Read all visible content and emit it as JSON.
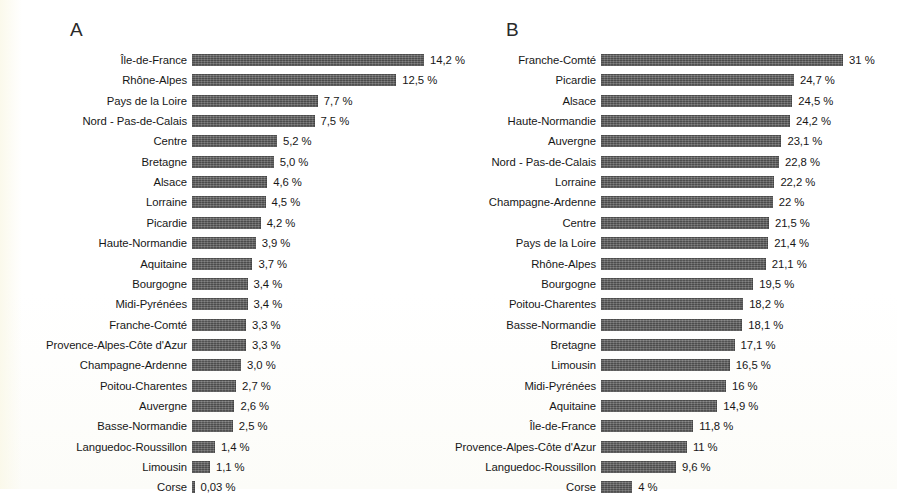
{
  "figure": {
    "background_color": "#fdfdfb",
    "bar_color": "#5f5f5f",
    "text_color": "#171717"
  },
  "panels": {
    "a": {
      "letter": "A",
      "bar_origin_x": 192,
      "px_per_unit": 16.34,
      "first_row_y": 50,
      "row_pitch": 20.35
    },
    "b": {
      "letter": "B",
      "bar_origin_x": 151,
      "px_per_unit": 7.81,
      "first_row_y": 50,
      "row_pitch": 20.35
    }
  },
  "chart_data": [
    {
      "type": "bar",
      "orientation": "horizontal",
      "panel": "A",
      "title": "A",
      "xlabel": "",
      "ylabel": "",
      "grid": false,
      "legend": false,
      "value_suffix": "%",
      "categories": [
        "Île-de-France",
        "Rhône-Alpes",
        "Pays de la Loire",
        "Nord - Pas-de-Calais",
        "Centre",
        "Bretagne",
        "Alsace",
        "Lorraine",
        "Picardie",
        "Haute-Normandie",
        "Aquitaine",
        "Bourgogne",
        "Midi-Pyrénées",
        "Franche-Comté",
        "Provence-Alpes-Côte d'Azur",
        "Champagne-Ardenne",
        "Poitou-Charentes",
        "Auvergne",
        "Basse-Normandie",
        "Languedoc-Roussillon",
        "Limousin",
        "Corse"
      ],
      "values": [
        14.2,
        12.5,
        7.7,
        7.5,
        5.2,
        5.0,
        4.6,
        4.5,
        4.2,
        3.9,
        3.7,
        3.4,
        3.4,
        3.3,
        3.3,
        3.0,
        2.7,
        2.6,
        2.5,
        1.4,
        1.1,
        0.03
      ],
      "value_labels": [
        "14,2 %",
        "12,5 %",
        "7,7 %",
        "7,5 %",
        "5,2 %",
        "5,0 %",
        "4,6 %",
        "4,5 %",
        "4,2 %",
        "3,9 %",
        "3,7 %",
        "3,4 %",
        "3,4 %",
        "3,3 %",
        "3,3 %",
        "3,0 %",
        "2,7 %",
        "2,6 %",
        "2,5 %",
        "1,4 %",
        "1,1 %",
        "0,03 %"
      ],
      "xlim": [
        0,
        15
      ]
    },
    {
      "type": "bar",
      "orientation": "horizontal",
      "panel": "B",
      "title": "B",
      "xlabel": "",
      "ylabel": "",
      "grid": false,
      "legend": false,
      "value_suffix": "%",
      "categories": [
        "Franche-Comté",
        "Picardie",
        "Alsace",
        "Haute-Normandie",
        "Auvergne",
        "Nord - Pas-de-Calais",
        "Lorraine",
        "Champagne-Ardenne",
        "Centre",
        "Pays de la Loire",
        "Rhône-Alpes",
        "Bourgogne",
        "Poitou-Charentes",
        "Basse-Normandie",
        "Bretagne",
        "Limousin",
        "Midi-Pyrénées",
        "Aquitaine",
        "Île-de-France",
        "Provence-Alpes-Côte d'Azur",
        "Languedoc-Roussillon",
        "Corse"
      ],
      "values": [
        31,
        24.7,
        24.5,
        24.2,
        23.1,
        22.8,
        22.2,
        22,
        21.5,
        21.4,
        21.1,
        19.5,
        18.2,
        18.1,
        17.1,
        16.5,
        16,
        14.9,
        11.8,
        11,
        9.6,
        4
      ],
      "value_labels": [
        "31 %",
        "24,7 %",
        "24,5 %",
        "24,2 %",
        "23,1 %",
        "22,8 %",
        "22,2 %",
        "22 %",
        "21,5 %",
        "21,4 %",
        "21,1 %",
        "19,5 %",
        "18,2 %",
        "18,1 %",
        "17,1 %",
        "16,5 %",
        "16 %",
        "14,9 %",
        "11,8 %",
        "11 %",
        "9,6 %",
        "4 %"
      ],
      "xlim": [
        0,
        32
      ]
    }
  ]
}
